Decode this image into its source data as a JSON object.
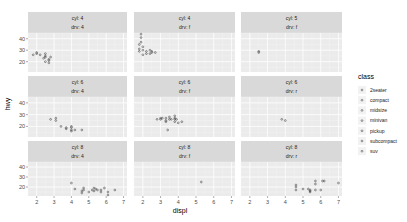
{
  "chart_data": {
    "type": "scatter",
    "title": "",
    "xlabel": "displ",
    "ylabel": "hwy",
    "facet": {
      "rows": "cyl",
      "cols": "drv",
      "layout": "wrap 3x3"
    },
    "xlim": [
      1.5,
      7.2
    ],
    "ylim": [
      11,
      45
    ],
    "x_ticks": [
      "2",
      "3",
      "4",
      "5",
      "6",
      "7"
    ],
    "y_ticks": [
      "20",
      "30",
      "40"
    ],
    "grid": true,
    "legend_position": "right",
    "legend": {
      "title": "class",
      "entries": [
        "2seater",
        "compact",
        "midsize",
        "minivan",
        "pickup",
        "subcompact",
        "suv"
      ]
    },
    "panels": [
      {
        "strip": [
          "cyl: 4",
          "drv: 4"
        ],
        "points": [
          [
            1.8,
            26
          ],
          [
            2.0,
            28
          ],
          [
            2.0,
            27
          ],
          [
            2.2,
            26
          ],
          [
            2.5,
            25
          ],
          [
            2.5,
            24
          ],
          [
            2.5,
            27
          ],
          [
            2.4,
            23
          ],
          [
            2.5,
            20
          ],
          [
            2.7,
            21
          ],
          [
            2.7,
            22
          ],
          [
            2.7,
            19
          ],
          [
            2.8,
            24
          ]
        ]
      },
      {
        "strip": [
          "cyl: 4",
          "drv: f"
        ],
        "points": [
          [
            1.8,
            29
          ],
          [
            1.8,
            31
          ],
          [
            2.0,
            30
          ],
          [
            2.0,
            33
          ],
          [
            2.0,
            26
          ],
          [
            1.9,
            44
          ],
          [
            1.9,
            41
          ],
          [
            1.9,
            37
          ],
          [
            1.8,
            35
          ],
          [
            2.2,
            29
          ],
          [
            2.4,
            30
          ],
          [
            2.4,
            27
          ],
          [
            2.5,
            28
          ],
          [
            2.5,
            29
          ],
          [
            2.7,
            28
          ],
          [
            2.2,
            27
          ]
        ]
      },
      {
        "strip": [
          "cyl: 5",
          "drv: f"
        ],
        "points": [
          [
            2.5,
            29
          ],
          [
            2.5,
            28
          ]
        ]
      },
      {
        "strip": [
          "cyl: 6",
          "drv: 4"
        ],
        "points": [
          [
            2.8,
            26
          ],
          [
            3.1,
            25
          ],
          [
            3.1,
            27
          ],
          [
            3.4,
            20
          ],
          [
            4.0,
            17
          ],
          [
            4.0,
            19
          ],
          [
            3.7,
            19
          ],
          [
            3.7,
            18
          ],
          [
            4.0,
            20
          ],
          [
            4.2,
            17
          ],
          [
            4.6,
            17
          ],
          [
            4.0,
            16
          ]
        ]
      },
      {
        "strip": [
          "cyl: 6",
          "drv: f"
        ],
        "points": [
          [
            2.8,
            26
          ],
          [
            3.0,
            26
          ],
          [
            3.1,
            27
          ],
          [
            3.3,
            24
          ],
          [
            3.3,
            25
          ],
          [
            3.5,
            26
          ],
          [
            3.5,
            28
          ],
          [
            3.6,
            26
          ],
          [
            3.8,
            26
          ],
          [
            3.8,
            27
          ],
          [
            3.8,
            24
          ],
          [
            3.8,
            29
          ],
          [
            3.9,
            26
          ],
          [
            4.0,
            23
          ],
          [
            4.2,
            24
          ],
          [
            3.4,
            17
          ],
          [
            3.0,
            27
          ],
          [
            3.3,
            27
          ]
        ]
      },
      {
        "strip": [
          "cyl: 6",
          "drv: r"
        ],
        "points": [
          [
            3.8,
            26
          ],
          [
            4.0,
            25
          ]
        ]
      },
      {
        "strip": [
          "cyl: 8",
          "drv: 4"
        ],
        "points": [
          [
            4.2,
            18
          ],
          [
            4.6,
            16
          ],
          [
            4.7,
            17
          ],
          [
            4.7,
            19
          ],
          [
            5.0,
            15
          ],
          [
            5.2,
            17
          ],
          [
            5.3,
            16
          ],
          [
            5.4,
            18
          ],
          [
            5.5,
            17
          ],
          [
            5.7,
            17
          ],
          [
            5.9,
            19
          ],
          [
            6.1,
            15
          ],
          [
            6.5,
            17
          ],
          [
            4.0,
            24
          ],
          [
            4.6,
            14
          ],
          [
            5.3,
            19
          ],
          [
            5.7,
            15
          ],
          [
            6.1,
            12
          ]
        ]
      },
      {
        "strip": [
          "cyl: 8",
          "drv: f"
        ],
        "points": [
          [
            5.3,
            25
          ]
        ]
      },
      {
        "strip": [
          "cyl: 8",
          "drv: r"
        ],
        "points": [
          [
            4.6,
            17
          ],
          [
            4.6,
            20
          ],
          [
            5.4,
            17
          ],
          [
            5.4,
            15
          ],
          [
            5.3,
            18
          ],
          [
            5.7,
            26
          ],
          [
            5.7,
            23
          ],
          [
            5.7,
            17
          ],
          [
            6.0,
            17
          ],
          [
            6.1,
            26
          ],
          [
            6.2,
            26
          ],
          [
            7.0,
            24
          ],
          [
            4.6,
            22
          ],
          [
            5.0,
            18
          ],
          [
            5.4,
            16
          ]
        ]
      }
    ]
  }
}
